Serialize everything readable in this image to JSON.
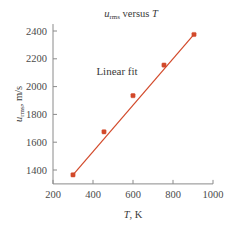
{
  "chart_data": {
    "type": "scatter",
    "title_parts": {
      "var": "u",
      "subscript": "rms",
      "connector": " versus ",
      "xvar": "T"
    },
    "xlabel": "T, K",
    "xlabel_parts": {
      "var": "T",
      "rest": ", K"
    },
    "ylabel": "u_rms, m/s",
    "ylabel_parts": {
      "var": "u",
      "subscript": "rms",
      "rest": ", m/s"
    },
    "xlim": [
      200,
      1000
    ],
    "ylim": [
      1300,
      2450
    ],
    "xticks": [
      200,
      400,
      600,
      800,
      1000
    ],
    "yticks": [
      1400,
      1600,
      1800,
      2000,
      2200,
      2400
    ],
    "grid": false,
    "legend_position": "none",
    "annotations": [
      {
        "text": "Linear fit",
        "x": 520,
        "y": 2080
      }
    ],
    "series": [
      {
        "name": "Linear fit",
        "type": "line",
        "color": "#d2492a",
        "x": [
          300,
          905
        ],
        "y": [
          1365,
          2375
        ]
      },
      {
        "name": "u_rms data",
        "type": "scatter",
        "color": "#d2492a",
        "x": [
          300,
          455,
          600,
          755,
          905
        ],
        "y": [
          1365,
          1675,
          1935,
          2155,
          2375
        ]
      }
    ],
    "points": [
      {
        "T": 300,
        "u_rms": 1365
      },
      {
        "T": 455,
        "u_rms": 1675
      },
      {
        "T": 600,
        "u_rms": 1935
      },
      {
        "T": 755,
        "u_rms": 2155
      },
      {
        "T": 905,
        "u_rms": 2375
      }
    ],
    "colors": {
      "data": "#d2492a",
      "axis": "#8a8a8a",
      "text": "#3a3a3a"
    }
  }
}
